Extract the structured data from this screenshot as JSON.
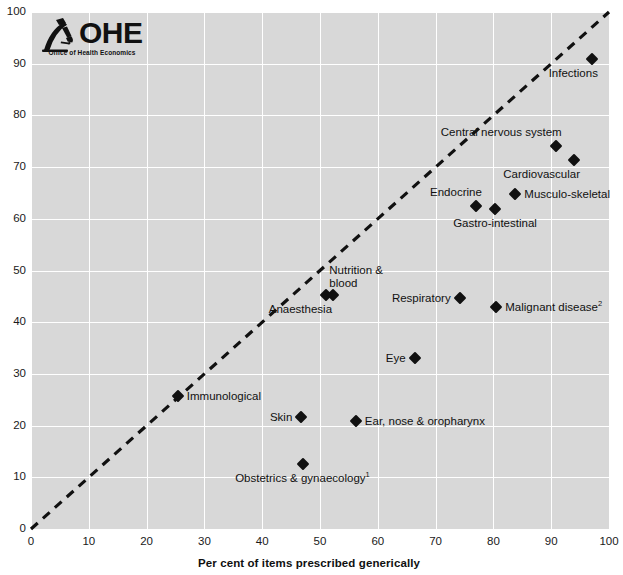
{
  "logo": {
    "wordmark": "OHE",
    "tagline": "Office of Health Economics",
    "icon_name": "microscope-icon"
  },
  "chart_data": {
    "type": "scatter",
    "title": "",
    "xlabel": "Per cent of items prescribed generically",
    "ylabel": "",
    "xlim": [
      0,
      100
    ],
    "ylim": [
      0,
      100
    ],
    "xticks": [
      "0",
      "10",
      "20",
      "30",
      "40",
      "50",
      "60",
      "70",
      "80",
      "90",
      "100"
    ],
    "yticks": [
      "0",
      "10",
      "20",
      "30",
      "40",
      "50",
      "60",
      "70",
      "80",
      "90",
      "100"
    ],
    "grid": true,
    "legend": "none",
    "reference_line": {
      "name": "diagonal-parity-line",
      "style": "dashed",
      "from": [
        0,
        0
      ],
      "to": [
        100,
        100
      ],
      "color": "#111111"
    },
    "plot_background": "#d8d8d8",
    "gridline_color": "#ffffff",
    "marker_color": "#111111",
    "marker_shape": "diamond",
    "points": [
      {
        "label": "Infections",
        "x": 97.0,
        "y": 91.0,
        "label_pos": "below-left"
      },
      {
        "label": "Central nervous system",
        "x": 90.8,
        "y": 74.1,
        "label_pos": "above-left"
      },
      {
        "label": "Cardiovascular",
        "x": 94.0,
        "y": 71.4,
        "label_pos": "below-left"
      },
      {
        "label": "Musculo-skeletal",
        "x": 83.8,
        "y": 64.8,
        "label_pos": "right"
      },
      {
        "label": "Endocrine",
        "x": 77.0,
        "y": 62.5,
        "label_pos": "above-left"
      },
      {
        "label": "Gastro-intestinal",
        "x": 80.3,
        "y": 61.9,
        "label_pos": "below"
      },
      {
        "label": "Nutrition & blood",
        "x": 52.3,
        "y": 45.2,
        "label_pos": "above-right"
      },
      {
        "label": "Anaesthesia",
        "x": 51.0,
        "y": 45.2,
        "label_pos": "below-left"
      },
      {
        "label": "Respiratory",
        "x": 74.2,
        "y": 44.7,
        "label_pos": "left"
      },
      {
        "label": "Malignant disease",
        "x": 80.5,
        "y": 43.0,
        "label_pos": "right",
        "footnote": "2"
      },
      {
        "label": "Eye",
        "x": 66.4,
        "y": 33.0,
        "label_pos": "left"
      },
      {
        "label": "Immunological",
        "x": 25.4,
        "y": 25.8,
        "label_pos": "right"
      },
      {
        "label": "Skin",
        "x": 46.7,
        "y": 21.6,
        "label_pos": "left"
      },
      {
        "label": "Ear, nose & oropharynx",
        "x": 56.2,
        "y": 20.8,
        "label_pos": "right"
      },
      {
        "label": "Obstetrics & gynaecology",
        "x": 47.0,
        "y": 12.6,
        "label_pos": "below",
        "footnote": "1"
      }
    ]
  }
}
